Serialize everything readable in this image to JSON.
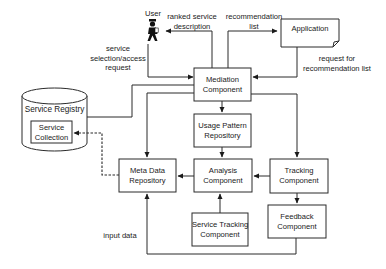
{
  "diagram": {
    "nodes": {
      "user": {
        "label": "User",
        "icon": "user-icon"
      },
      "application": {
        "label": "Application"
      },
      "mediation": {
        "line1": "Mediation",
        "line2": "Component"
      },
      "usage_pattern": {
        "line1": "Usage Pattern",
        "line2": "Repository"
      },
      "analysis": {
        "line1": "Analysis",
        "line2": "Component"
      },
      "tracking": {
        "line1": "Tracking",
        "line2": "Component"
      },
      "feedback": {
        "line1": "Feedback",
        "line2": "Component"
      },
      "service_tracking": {
        "line1": "Service Tracking",
        "line2": "Component"
      },
      "meta_data": {
        "line1": "Meta Data",
        "line2": "Repository"
      },
      "service_registry": {
        "label": "Service Registry"
      },
      "service_collection": {
        "line1": "Service",
        "line2": "Collection"
      }
    },
    "edge_labels": {
      "ranked": {
        "line1": "ranked service",
        "line2": "description"
      },
      "recommendation": {
        "line1": "recommendation",
        "line2": "list"
      },
      "service_selection": {
        "line1": "service",
        "line2": "selection/access",
        "line3": "request"
      },
      "request_for": {
        "line1": "request for",
        "line2": "recommendation list"
      },
      "input_data": "input data"
    },
    "edges": [
      {
        "from": "user",
        "to": "mediation",
        "label": "service selection/access request"
      },
      {
        "from": "mediation",
        "to": "user",
        "label": "ranked service description"
      },
      {
        "from": "mediation",
        "to": "application",
        "label": "recommendation list"
      },
      {
        "from": "application",
        "to": "mediation",
        "label": "request for recommendation list"
      },
      {
        "from": "service_registry",
        "to": "mediation",
        "label": ""
      },
      {
        "from": "mediation",
        "to": "meta_data",
        "label": ""
      },
      {
        "from": "mediation",
        "to": "usage_pattern",
        "label": ""
      },
      {
        "from": "mediation",
        "to": "tracking",
        "label": ""
      },
      {
        "from": "usage_pattern",
        "to": "analysis",
        "label": ""
      },
      {
        "from": "analysis",
        "to": "meta_data",
        "label": ""
      },
      {
        "from": "tracking",
        "to": "analysis",
        "label": ""
      },
      {
        "from": "service_tracking",
        "to": "analysis",
        "label": ""
      },
      {
        "from": "tracking",
        "to": "feedback",
        "label": ""
      },
      {
        "from": "feedback",
        "to": "meta_data",
        "label": "input data"
      },
      {
        "from": "meta_data",
        "to": "service_collection",
        "label": "",
        "style": "dashed"
      }
    ]
  }
}
